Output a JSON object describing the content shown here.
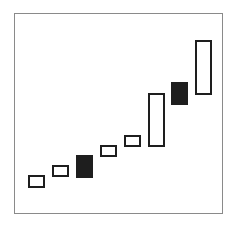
{
  "chart_data": {
    "type": "candlestick",
    "title": "",
    "xlabel": "",
    "ylabel": "",
    "grid": false,
    "legend": null,
    "wicks": false,
    "trend": "rising",
    "ylim": [
      0,
      200
    ],
    "colors": {
      "up_fill": "#ffffff",
      "down_fill": "#1e1e1e",
      "outline": "#1e1e1e",
      "frame": "#8a8a8a"
    },
    "candles": [
      {
        "index": 1,
        "direction": "up",
        "open": 26,
        "close": 39
      },
      {
        "index": 2,
        "direction": "up",
        "open": 37,
        "close": 49
      },
      {
        "index": 3,
        "direction": "down",
        "open": 59,
        "close": 36
      },
      {
        "index": 4,
        "direction": "up",
        "open": 57,
        "close": 69
      },
      {
        "index": 5,
        "direction": "up",
        "open": 67,
        "close": 79
      },
      {
        "index": 6,
        "direction": "up",
        "open": 67,
        "close": 121
      },
      {
        "index": 7,
        "direction": "down",
        "open": 132,
        "close": 109
      },
      {
        "index": 8,
        "direction": "up",
        "open": 119,
        "close": 174
      }
    ]
  }
}
